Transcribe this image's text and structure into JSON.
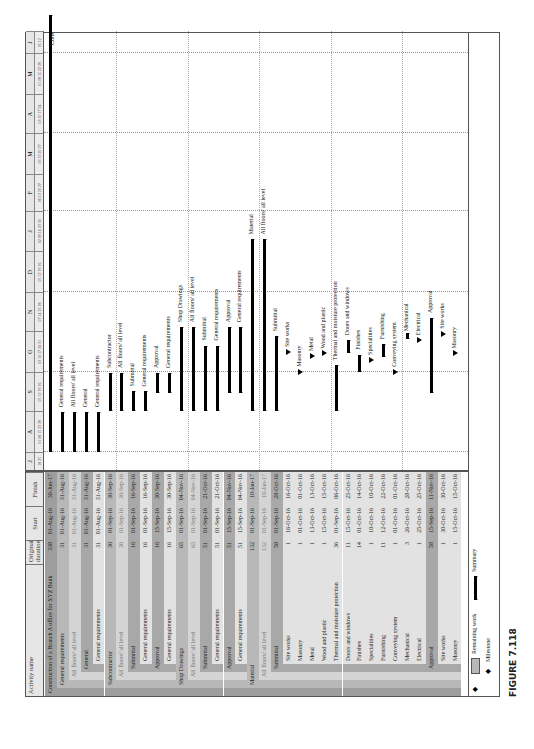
{
  "figure": {
    "caption": "FIGURE 7.118"
  },
  "table": {
    "headers": {
      "name": "Activity name",
      "duration": "Original duration",
      "start": "Start",
      "finish": "Finish"
    },
    "rows": [
      {
        "name": "Construction of a Branch A office for XYZ Bank",
        "dur": "338",
        "start": "01-Aug-16",
        "finish": "30-Jun-17",
        "level": 0,
        "indent": 0,
        "type": "summary"
      },
      {
        "name": "General requirements",
        "dur": "31",
        "start": "01-Aug-16",
        "finish": "31-Aug-16",
        "level": 1,
        "indent": 1,
        "type": "summary"
      },
      {
        "name": "All floors/ all level",
        "dur": "31",
        "start": "01-Aug-16",
        "finish": "31-Aug-16",
        "level": 2,
        "indent": 2,
        "type": "summary",
        "light": true
      },
      {
        "name": "General",
        "dur": "31",
        "start": "01-Aug-16",
        "finish": "31-Aug-16",
        "level": 3,
        "indent": 3,
        "type": "summary"
      },
      {
        "name": "General requirements",
        "dur": "31",
        "start": "01-Aug-16",
        "finish": "31-Aug-16",
        "level": 4,
        "indent": 4,
        "type": "summary"
      },
      {
        "name": "Subcontractor",
        "dur": "30",
        "start": "01-Sep-16",
        "finish": "30-Sep-16",
        "level": 1,
        "indent": 1,
        "type": "summary"
      },
      {
        "name": "All floors/ all level",
        "dur": "30",
        "start": "01-Sep-16",
        "finish": "30-Sep-16",
        "level": 2,
        "indent": 2,
        "type": "summary",
        "light": true
      },
      {
        "name": "Submittal",
        "dur": "16",
        "start": "01-Sep-16",
        "finish": "16-Sep-16",
        "level": 3,
        "indent": 3,
        "type": "summary"
      },
      {
        "name": "General requirements",
        "dur": "16",
        "start": "01-Sep-16",
        "finish": "16-Sep-16",
        "level": 4,
        "indent": 4,
        "type": "summary"
      },
      {
        "name": "Approval",
        "dur": "16",
        "start": "15-Sep-16",
        "finish": "30-Sep-16",
        "level": 3,
        "indent": 3,
        "type": "summary"
      },
      {
        "name": "General requirements",
        "dur": "16",
        "start": "15-Sep-16",
        "finish": "30-Sep-16",
        "level": 4,
        "indent": 4,
        "type": "summary"
      },
      {
        "name": "Shop Drawings",
        "dur": "65",
        "start": "01-Sep-16",
        "finish": "04-Nov-16",
        "level": 1,
        "indent": 1,
        "type": "summary"
      },
      {
        "name": "All floors/ all level",
        "dur": "65",
        "start": "01-Sep-16",
        "finish": "04-Nov-16",
        "level": 2,
        "indent": 2,
        "type": "summary",
        "light": true
      },
      {
        "name": "Submittal",
        "dur": "51",
        "start": "01-Sep-16",
        "finish": "21-Oct-16",
        "level": 3,
        "indent": 3,
        "type": "summary"
      },
      {
        "name": "General requirements",
        "dur": "51",
        "start": "01-Sep-16",
        "finish": "21-Oct-16",
        "level": 4,
        "indent": 4,
        "type": "summary"
      },
      {
        "name": "Approval",
        "dur": "51",
        "start": "15-Sep-16",
        "finish": "04-Nov-16",
        "level": 3,
        "indent": 3,
        "type": "summary"
      },
      {
        "name": "General requirements",
        "dur": "51",
        "start": "15-Sep-16",
        "finish": "04-Nov-16",
        "level": 4,
        "indent": 4,
        "type": "summary"
      },
      {
        "name": "Material",
        "dur": "132",
        "start": "01-Sep-16",
        "finish": "10-Jan-17",
        "level": 1,
        "indent": 1,
        "type": "summary"
      },
      {
        "name": "All floors/ all level",
        "dur": "132",
        "start": "01-Sep-16",
        "finish": "10-Jan-17",
        "level": 2,
        "indent": 2,
        "type": "summary",
        "light": true
      },
      {
        "name": "Submittal",
        "dur": "58",
        "start": "01-Sep-16",
        "finish": "28-Oct-16",
        "level": 3,
        "indent": 3,
        "type": "summary"
      },
      {
        "name": "Site works",
        "dur": "1",
        "start": "16-Oct-16",
        "finish": "16-Oct-16",
        "level": 4,
        "indent": 4,
        "type": "task"
      },
      {
        "name": "Masonry",
        "dur": "1",
        "start": "01-Oct-16",
        "finish": "01-Oct-16",
        "level": 4,
        "indent": 4,
        "type": "task"
      },
      {
        "name": "Metal",
        "dur": "1",
        "start": "13-Oct-16",
        "finish": "13-Oct-16",
        "level": 4,
        "indent": 4,
        "type": "task"
      },
      {
        "name": "Wood and plastic",
        "dur": "1",
        "start": "15-Oct-16",
        "finish": "15-Oct-16",
        "level": 4,
        "indent": 4,
        "type": "task"
      },
      {
        "name": "Thermal and moisture protection",
        "dur": "36",
        "start": "01-Sep-16",
        "finish": "06-Oct-16",
        "level": 4,
        "indent": 4,
        "type": "summary"
      },
      {
        "name": "Doors and windows",
        "dur": "11",
        "start": "15-Oct-16",
        "finish": "25-Oct-16",
        "level": 4,
        "indent": 4,
        "type": "summary"
      },
      {
        "name": "Finishes",
        "dur": "14",
        "start": "01-Oct-16",
        "finish": "14-Oct-16",
        "level": 4,
        "indent": 4,
        "type": "summary"
      },
      {
        "name": "Specialities",
        "dur": "1",
        "start": "10-Oct-16",
        "finish": "10-Oct-16",
        "level": 4,
        "indent": 4,
        "type": "task"
      },
      {
        "name": "Furnishing",
        "dur": "11",
        "start": "12-Oct-16",
        "finish": "22-Oct-16",
        "level": 4,
        "indent": 4,
        "type": "summary"
      },
      {
        "name": "Conveying system",
        "dur": "1",
        "start": "01-Oct-16",
        "finish": "01-Oct-16",
        "level": 4,
        "indent": 4,
        "type": "task"
      },
      {
        "name": "Mechanical",
        "dur": "3",
        "start": "26-Oct-16",
        "finish": "28-Oct-16",
        "level": 4,
        "indent": 4,
        "type": "summary"
      },
      {
        "name": "Electrical",
        "dur": "1",
        "start": "25-Oct-16",
        "finish": "25-Oct-16",
        "level": 4,
        "indent": 4,
        "type": "task"
      },
      {
        "name": "Approval",
        "dur": "58",
        "start": "15-Sep-16",
        "finish": "11-Nov-16",
        "level": 3,
        "indent": 3,
        "type": "summary"
      },
      {
        "name": "Site works",
        "dur": "1",
        "start": "30-Oct-16",
        "finish": "30-Oct-16",
        "level": 4,
        "indent": 4,
        "type": "task"
      },
      {
        "name": "Masonry",
        "dur": "1",
        "start": "15-Oct-16",
        "finish": "15-Oct-16",
        "level": 4,
        "indent": 4,
        "type": "task"
      }
    ]
  },
  "timeline": {
    "months": [
      "J",
      "A",
      "S",
      "O",
      "N",
      "D",
      "J",
      "F",
      "M",
      "A",
      "M",
      "J"
    ],
    "weeks": [
      [
        "18",
        "25"
      ],
      [
        "01",
        "08",
        "15",
        "22",
        "29"
      ],
      [
        "05",
        "12",
        "19",
        "26"
      ],
      [
        "03",
        "10",
        "17",
        "24",
        "31"
      ],
      [
        "07",
        "14",
        "21",
        "28"
      ],
      [
        "05",
        "12",
        "19",
        "26"
      ],
      [
        "02",
        "09",
        "16",
        "23",
        "30"
      ],
      [
        "06",
        "13",
        "20",
        "27"
      ],
      [
        "06",
        "13",
        "20",
        "27"
      ],
      [
        "03",
        "10",
        "17",
        "24"
      ],
      [
        "01",
        "08",
        "15",
        "22",
        "29"
      ],
      [
        "05",
        "12"
      ]
    ],
    "end_label": "Cons"
  },
  "legend": {
    "remaining": "Remaining work",
    "milestone": "Milestone",
    "summary": "Summary"
  },
  "chart_data": {
    "type": "gantt",
    "title": "Construction of a Branch A office for XYZ Bank",
    "xlabel": "Timeline (Jul 2016 – Jun 2017)",
    "categories": [
      "Construction of a Branch A office for XYZ Bank",
      "General requirements",
      "All floors/ all level",
      "General",
      "General requirements",
      "Subcontractor",
      "All floors/ all level",
      "Submittal",
      "General requirements",
      "Approval",
      "General requirements",
      "Shop Drawings",
      "All floors/ all level",
      "Submittal",
      "General requirements",
      "Approval",
      "General requirements",
      "Material",
      "All floors/ all level",
      "Submittal",
      "Site works",
      "Masonry",
      "Metal",
      "Wood and plastic",
      "Thermal and moisture protection",
      "Doors and windows",
      "Finishes",
      "Specialities",
      "Furnishing",
      "Conveying system",
      "Mechanical",
      "Electrical",
      "Approval",
      "Site works",
      "Masonry"
    ],
    "series": [
      {
        "name": "Original duration",
        "values": [
          338,
          31,
          31,
          31,
          31,
          30,
          30,
          16,
          16,
          16,
          16,
          65,
          65,
          51,
          51,
          51,
          51,
          132,
          132,
          58,
          1,
          1,
          1,
          1,
          36,
          11,
          14,
          1,
          11,
          1,
          3,
          1,
          58,
          1,
          1
        ]
      },
      {
        "name": "Start",
        "values": [
          "01-Aug-16",
          "01-Aug-16",
          "01-Aug-16",
          "01-Aug-16",
          "01-Aug-16",
          "01-Sep-16",
          "01-Sep-16",
          "01-Sep-16",
          "01-Sep-16",
          "15-Sep-16",
          "15-Sep-16",
          "01-Sep-16",
          "01-Sep-16",
          "01-Sep-16",
          "01-Sep-16",
          "15-Sep-16",
          "15-Sep-16",
          "01-Sep-16",
          "01-Sep-16",
          "01-Sep-16",
          "16-Oct-16",
          "01-Oct-16",
          "13-Oct-16",
          "15-Oct-16",
          "01-Sep-16",
          "15-Oct-16",
          "01-Oct-16",
          "10-Oct-16",
          "12-Oct-16",
          "01-Oct-16",
          "26-Oct-16",
          "25-Oct-16",
          "15-Sep-16",
          "30-Oct-16",
          "15-Oct-16"
        ]
      },
      {
        "name": "Finish",
        "values": [
          "30-Jun-17",
          "31-Aug-16",
          "31-Aug-16",
          "31-Aug-16",
          "31-Aug-16",
          "30-Sep-16",
          "30-Sep-16",
          "16-Sep-16",
          "16-Sep-16",
          "30-Sep-16",
          "30-Sep-16",
          "04-Nov-16",
          "04-Nov-16",
          "21-Oct-16",
          "21-Oct-16",
          "04-Nov-16",
          "04-Nov-16",
          "10-Jan-17",
          "10-Jan-17",
          "28-Oct-16",
          "16-Oct-16",
          "01-Oct-16",
          "13-Oct-16",
          "15-Oct-16",
          "06-Oct-16",
          "25-Oct-16",
          "14-Oct-16",
          "10-Oct-16",
          "22-Oct-16",
          "01-Oct-16",
          "28-Oct-16",
          "25-Oct-16",
          "11-Nov-16",
          "30-Oct-16",
          "15-Oct-16"
        ]
      }
    ],
    "legend": [
      "Remaining work",
      "Milestone",
      "Summary"
    ]
  }
}
